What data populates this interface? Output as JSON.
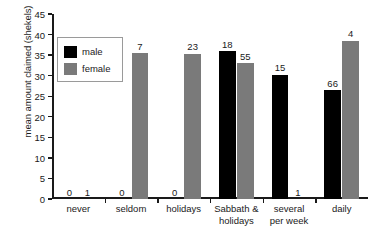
{
  "chart_data": {
    "type": "bar",
    "title": "",
    "xlabel": "",
    "ylabel": "mean amount claimed (shekels)",
    "ylim": [
      0,
      45
    ],
    "ytick_step": 5,
    "yticks": [
      "0",
      "5",
      "10",
      "15",
      "20",
      "25",
      "30",
      "35",
      "40",
      "45"
    ],
    "grid": false,
    "legend_position": "upper-left-inside",
    "categories": [
      "never",
      "seldom",
      "holidays",
      "Sabbath &\nholidays",
      "several\nper week",
      "daily"
    ],
    "series": [
      {
        "name": "male",
        "color": "#000000",
        "values": [
          0,
          0,
          0,
          36.0,
          30.2,
          26.5
        ],
        "counts": [
          "0",
          "0",
          "0",
          "18",
          "15",
          "66"
        ]
      },
      {
        "name": "female",
        "color": "#7a7a7a",
        "values": [
          0,
          35.5,
          35.3,
          33.0,
          0,
          38.5
        ],
        "counts": [
          "1",
          "7",
          "23",
          "55",
          "1",
          "4"
        ]
      }
    ],
    "annotation_note": "numbers above bars are sample sizes (n)"
  },
  "legend": {
    "items": [
      {
        "label": "male",
        "swatch": "male-swatch"
      },
      {
        "label": "female",
        "swatch": "female-swatch"
      }
    ]
  }
}
